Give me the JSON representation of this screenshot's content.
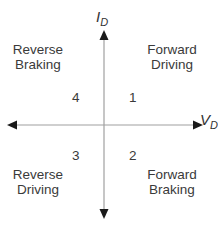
{
  "diagram": {
    "type": "four-quadrant-plot",
    "axes": {
      "vertical": {
        "label": "I",
        "subscript": "D"
      },
      "horizontal": {
        "label": "V",
        "subscript": "D"
      }
    },
    "quadrants": [
      {
        "number": "1",
        "line1": "Forward",
        "line2": "Driving"
      },
      {
        "number": "2",
        "line1": "Forward",
        "line2": "Braking"
      },
      {
        "number": "3",
        "line1": "Reverse",
        "line2": "Driving"
      },
      {
        "number": "4",
        "line1": "Reverse",
        "line2": "Braking"
      }
    ],
    "colors": {
      "axis": "#9a9a9a",
      "arrowhead": "#1a1a1a",
      "text": "#3a3a3a"
    }
  }
}
